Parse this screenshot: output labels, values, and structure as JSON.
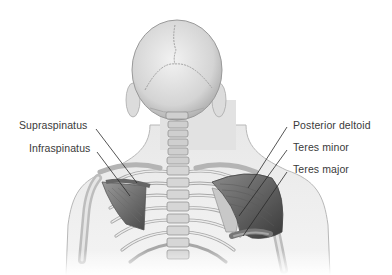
{
  "diagram": {
    "labels_left": [
      {
        "text": "Supraspinatus",
        "x": 19,
        "y": 119
      },
      {
        "text": "Infraspinatus",
        "x": 29,
        "y": 142
      }
    ],
    "labels_right": [
      {
        "text": "Posterior deltoid",
        "x": 293,
        "y": 119
      },
      {
        "text": "Teres minor",
        "x": 293,
        "y": 141
      },
      {
        "text": "Teres major",
        "x": 293,
        "y": 163
      }
    ],
    "colors": {
      "background": "#ffffff",
      "label_text": "#3a3a3a",
      "leader_line": "#2a2a2a",
      "skin": "#e6e6e6",
      "bone": "#d2d2d2",
      "muscle_dark": "#4a4a4a",
      "muscle_mid": "#7a7a7a"
    }
  }
}
